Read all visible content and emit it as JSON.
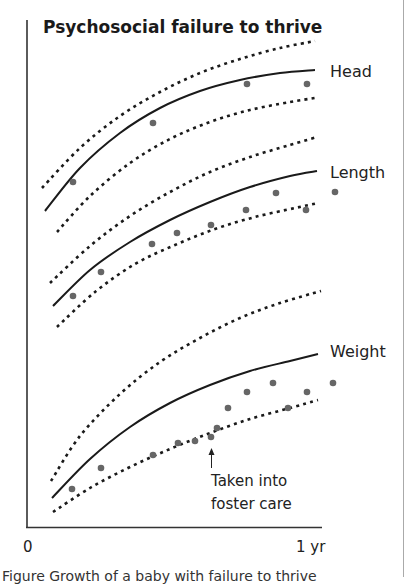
{
  "chart_data": {
    "type": "line",
    "title": "Psychosocial failure to thrive",
    "xlabel": "",
    "ylabel": "",
    "x_ticks": [
      "0",
      "1 yr"
    ],
    "xlim": [
      0,
      1
    ],
    "grid": false,
    "legend": "none (series labelled directly at right end of curves)",
    "series_labels": [
      "Head",
      "Length",
      "Weight"
    ],
    "series": [
      {
        "name": "Head",
        "reference_curves": {
          "upper_dotted": [
            [
              42,
              188
            ],
            [
              80,
              148
            ],
            [
              120,
              116
            ],
            [
              160,
              92
            ],
            [
              200,
              73
            ],
            [
              240,
              59
            ],
            [
              280,
              48
            ],
            [
              315,
              41
            ]
          ],
          "median_solid": [
            [
              45,
              211
            ],
            [
              80,
              168
            ],
            [
              120,
              133
            ],
            [
              160,
              108
            ],
            [
              200,
              91
            ],
            [
              240,
              80
            ],
            [
              280,
              73
            ],
            [
              315,
              70
            ]
          ],
          "lower_dotted": [
            [
              57,
              232
            ],
            [
              90,
              196
            ],
            [
              130,
              163
            ],
            [
              170,
              139
            ],
            [
              210,
              122
            ],
            [
              250,
              110
            ],
            [
              290,
              102
            ],
            [
              315,
              98
            ]
          ]
        },
        "points": [
          [
            73,
            182
          ],
          [
            153,
            123
          ],
          [
            247,
            84
          ],
          [
            307,
            84
          ]
        ]
      },
      {
        "name": "Length",
        "reference_curves": {
          "upper_dotted": [
            [
              50,
              283
            ],
            [
              90,
              246
            ],
            [
              130,
              216
            ],
            [
              170,
              192
            ],
            [
              210,
              172
            ],
            [
              250,
              157
            ],
            [
              290,
              145
            ],
            [
              317,
              137
            ]
          ],
          "median_solid": [
            [
              53,
              306
            ],
            [
              90,
              270
            ],
            [
              130,
              242
            ],
            [
              170,
              220
            ],
            [
              210,
              202
            ],
            [
              250,
              187
            ],
            [
              290,
              176
            ],
            [
              317,
              171
            ]
          ],
          "lower_dotted": [
            [
              57,
              327
            ],
            [
              95,
              292
            ],
            [
              135,
              264
            ],
            [
              175,
              245
            ],
            [
              215,
              229
            ],
            [
              255,
              217
            ],
            [
              295,
              208
            ],
            [
              318,
              203
            ]
          ]
        },
        "points": [
          [
            73,
            296
          ],
          [
            101,
            272
          ],
          [
            152,
            244
          ],
          [
            177,
            233
          ],
          [
            211,
            225
          ],
          [
            246,
            210
          ],
          [
            276,
            193
          ],
          [
            306,
            210
          ],
          [
            335,
            192
          ]
        ]
      },
      {
        "name": "Weight",
        "reference_curves": {
          "upper_dotted": [
            [
              51,
              481
            ],
            [
              80,
              436
            ],
            [
              120,
              394
            ],
            [
              160,
              362
            ],
            [
              200,
              338
            ],
            [
              240,
              318
            ],
            [
              280,
              303
            ],
            [
              321,
              291
            ]
          ],
          "median_solid": [
            [
              52,
              498
            ],
            [
              90,
              459
            ],
            [
              130,
              427
            ],
            [
              170,
              403
            ],
            [
              210,
              385
            ],
            [
              250,
              371
            ],
            [
              290,
              361
            ],
            [
              318,
              354
            ]
          ],
          "lower_dotted": [
            [
              53,
              512
            ],
            [
              90,
              488
            ],
            [
              130,
              467
            ],
            [
              170,
              449
            ],
            [
              210,
              433
            ],
            [
              250,
              419
            ],
            [
              290,
              408
            ],
            [
              318,
              400
            ]
          ]
        },
        "points": [
          [
            72,
            489
          ],
          [
            101,
            468
          ],
          [
            153,
            455
          ],
          [
            178,
            443
          ],
          [
            195,
            441
          ],
          [
            211,
            437
          ],
          [
            217,
            428
          ],
          [
            228,
            408
          ],
          [
            247,
            392
          ],
          [
            273,
            383
          ],
          [
            288,
            408
          ],
          [
            307,
            392
          ],
          [
            333,
            383
          ]
        ]
      }
    ],
    "annotations": [
      {
        "text_line1": "Taken into",
        "text_line2": "foster care",
        "arrow_x": 211,
        "arrow_from_y": 468,
        "arrow_to_y": 450
      }
    ]
  },
  "labels": {
    "title": "Psychosocial failure to thrive",
    "head": "Head",
    "length": "Length",
    "weight": "Weight",
    "x_start": "0",
    "x_end": "1 yr",
    "annotation_line1": "Taken into",
    "annotation_line2": "foster care",
    "caption": "Figure    Growth of a baby with failure to thrive"
  },
  "colors": {
    "curve": "#1a1a1a",
    "point": "#666666",
    "axis": "#333333",
    "border": "#aaaaaa"
  }
}
